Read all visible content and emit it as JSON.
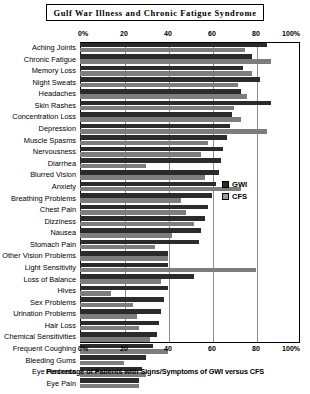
{
  "chart_data": {
    "type": "bar",
    "orientation": "horizontal",
    "title": "Gulf War Illness and Chronic Fatigue Syndrome",
    "xlabel": "Percentage of Patients with Signs/Symptoms of GWI versus CFS",
    "ylabel": "",
    "xlim": [
      0,
      100
    ],
    "grid": true,
    "legend_position": "right-middle",
    "xticks": [
      "0%",
      "20",
      "40",
      "60",
      "80",
      "100%"
    ],
    "xtick_values": [
      0,
      20,
      40,
      60,
      80,
      100
    ],
    "categories": [
      "Aching Joints",
      "Chronic Fatigue",
      "Memory Loss",
      "Night Sweats",
      "Headaches",
      "Skin Rashes",
      "Concentration Loss",
      "Depression",
      "Muscle Spasms",
      "Nervousness",
      "Diarrhea",
      "Blurred Vision",
      "Anxiety",
      "Breathing Problems",
      "Chest Pain",
      "Dizziness",
      "Nausea",
      "Stomach Pain",
      "Other Vision Problems",
      "Light Sensitivity",
      "Loss of Balance",
      "Hives",
      "Sex Problems",
      "Urination Problems",
      "Hair Loss",
      "Chemical Sensitivities",
      "Frequent Coughing",
      "Bleeding Gums",
      "Eye Redness",
      "Eye Pain"
    ],
    "series": [
      {
        "name": "GWI",
        "color": "#2b2b2b",
        "values": [
          85,
          78,
          74,
          82,
          73,
          87,
          69,
          68,
          67,
          65,
          64,
          63,
          62,
          60,
          58,
          57,
          55,
          54,
          40,
          40,
          52,
          40,
          38,
          37,
          36,
          35,
          33,
          30,
          28,
          27
        ]
      },
      {
        "name": "CFS",
        "color": "#7d7d7d",
        "values": [
          75,
          87,
          78,
          72,
          76,
          70,
          73,
          85,
          58,
          55,
          30,
          57,
          73,
          46,
          48,
          52,
          42,
          34,
          40,
          80,
          37,
          14,
          24,
          26,
          27,
          32,
          40,
          20,
          30,
          27
        ]
      }
    ]
  },
  "legend": {
    "items": [
      {
        "label": "GWI"
      },
      {
        "label": "CFS"
      }
    ]
  }
}
